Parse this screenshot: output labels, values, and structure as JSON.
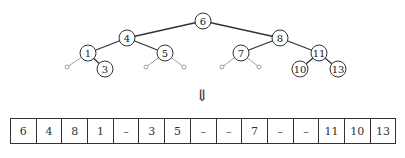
{
  "diagram": {
    "type": "binary-search-tree-to-array",
    "tree": {
      "nodes": [
        {
          "id": "n6",
          "label": "6",
          "x": 203,
          "y": 21
        },
        {
          "id": "n4",
          "label": "4",
          "x": 127,
          "y": 38
        },
        {
          "id": "n8",
          "label": "8",
          "x": 280,
          "y": 38
        },
        {
          "id": "n1",
          "label": "1",
          "x": 88,
          "y": 53
        },
        {
          "id": "n5",
          "label": "5",
          "x": 165,
          "y": 53
        },
        {
          "id": "n7",
          "label": "7",
          "x": 241,
          "y": 53
        },
        {
          "id": "n11",
          "label": "11",
          "x": 319,
          "y": 53
        },
        {
          "id": "n3",
          "label": "3",
          "x": 105,
          "y": 69
        },
        {
          "id": "n10",
          "label": "10",
          "x": 300,
          "y": 69
        },
        {
          "id": "n13",
          "label": "13",
          "x": 338,
          "y": 69
        }
      ],
      "edges": [
        [
          "n6",
          "n4"
        ],
        [
          "n6",
          "n8"
        ],
        [
          "n4",
          "n1"
        ],
        [
          "n4",
          "n5"
        ],
        [
          "n8",
          "n7"
        ],
        [
          "n8",
          "n11"
        ],
        [
          "n1",
          "n3"
        ],
        [
          "n11",
          "n10"
        ],
        [
          "n11",
          "n13"
        ]
      ],
      "null_leaves": [
        {
          "parent": "n1",
          "x": 67,
          "y": 67
        },
        {
          "parent": "n5",
          "x": 146,
          "y": 67
        },
        {
          "parent": "n5",
          "x": 184,
          "y": 67
        },
        {
          "parent": "n7",
          "x": 222,
          "y": 67
        },
        {
          "parent": "n7",
          "x": 259,
          "y": 67
        }
      ]
    },
    "arrow": "⇓",
    "array": [
      "6",
      "4",
      "8",
      "1",
      "–",
      "3",
      "5",
      "–",
      "–",
      "7",
      "–",
      "–",
      "11",
      "10",
      "13"
    ]
  }
}
